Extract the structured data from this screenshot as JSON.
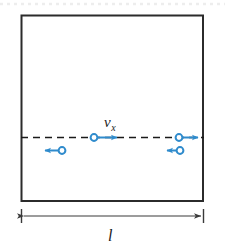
{
  "figure": {
    "type": "physics-diagram",
    "labels": {
      "velocity_symbol": "v",
      "velocity_subscript": "x",
      "velocity_full": "v_x",
      "length_symbol": "l"
    },
    "colors": {
      "container_stroke": "#2b2b2b",
      "particle_blue": "#2f8bcc",
      "axis_dash": "#1a1a1a",
      "dimension_line": "#3a3a3a",
      "background": "#ffffff",
      "top_dotted": "#ededed"
    },
    "container": {
      "x": 21,
      "y": 15,
      "width": 182,
      "height": 186,
      "stroke_width": 2
    },
    "axis": {
      "y": 137,
      "x_start": 21,
      "x_end": 203,
      "style": "dashed"
    },
    "particles": [
      {
        "id": "particle-center-right-moving",
        "circle_x": 94,
        "circle_y": 137,
        "direction": "right",
        "arrow_tip_x": 123,
        "labeled": true
      },
      {
        "id": "particle-left-left-moving",
        "circle_x": 62,
        "circle_y": 150,
        "direction": "left",
        "arrow_tip_x": 39,
        "labeled": false
      },
      {
        "id": "particle-right-right-moving",
        "circle_x": 179,
        "circle_y": 137,
        "direction": "right",
        "arrow_tip_x": 204,
        "labeled": false
      },
      {
        "id": "particle-right-left-moving",
        "circle_x": 180,
        "circle_y": 150,
        "direction": "left",
        "arrow_tip_x": 161,
        "labeled": false
      }
    ],
    "dimension": {
      "y": 216,
      "x_start": 21,
      "x_end": 203,
      "tick_half_height": 7,
      "label_x": 112,
      "label_y": 240
    }
  }
}
